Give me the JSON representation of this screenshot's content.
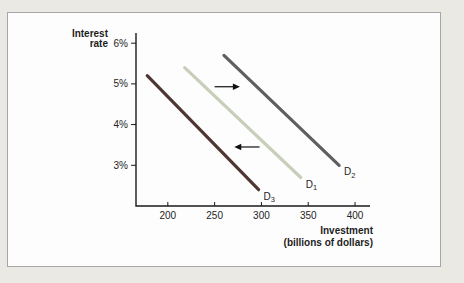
{
  "figure": {
    "background_color": "#ebe9e4",
    "panel_background": "#fdfdfd",
    "panel_border_color": "#a6a6a6",
    "axis_color": "#1a1a1a",
    "arrow_color": "#111111"
  },
  "chart_data": {
    "type": "line",
    "title": "",
    "xlabel": "Investment",
    "xlabel_sub": "(billions of dollars)",
    "ylabel": "Interest rate",
    "xlim": [
      166,
      416
    ],
    "ylim": [
      2.0,
      6.25
    ],
    "grid": false,
    "legend_position": "none",
    "x_ticks": [
      200,
      250,
      300,
      350,
      400
    ],
    "x_tick_labels": [
      "200",
      "250",
      "300",
      "350",
      "400"
    ],
    "y_ticks": [
      3,
      4,
      5,
      6
    ],
    "y_tick_labels": [
      "3%",
      "4%",
      "5%",
      "6%"
    ],
    "series": [
      {
        "id": "d3",
        "label": "D",
        "sub": "3",
        "name": "D3",
        "color": "#4e3733",
        "points": [
          [
            178,
            5.2
          ],
          [
            297,
            2.4
          ]
        ]
      },
      {
        "id": "d1",
        "label": "D",
        "sub": "1",
        "name": "D1",
        "color": "#c8cfb9",
        "points": [
          [
            218,
            5.4
          ],
          [
            342,
            2.7
          ]
        ]
      },
      {
        "id": "d2",
        "label": "D",
        "sub": "2",
        "name": "D2",
        "color": "#5e5f61",
        "points": [
          [
            260,
            5.7
          ],
          [
            383,
            3.0
          ]
        ]
      }
    ],
    "arrows": [
      {
        "direction": "right",
        "x_from": 250,
        "x_to": 277,
        "rate": 4.93
      },
      {
        "direction": "left",
        "x_from": 298,
        "x_to": 271,
        "rate": 3.45
      }
    ]
  }
}
